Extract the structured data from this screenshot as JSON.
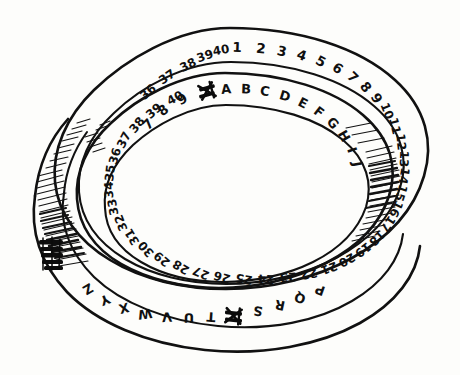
{
  "figure": {
    "medium": "ink sketch on white paper",
    "background_color": "#fdfdfb",
    "ink_color": "#111111",
    "annotation_note": "illegible handwritten scribble at left edge of band"
  },
  "outer_band": {
    "name": "numbered outer band",
    "label_kind": "numbers",
    "sequence_start": 1,
    "sequence_end": 40,
    "labels": [
      "1",
      "2",
      "3",
      "4",
      "5",
      "6",
      "7",
      "8",
      "9",
      "10",
      "11",
      "12",
      "13",
      "14",
      "15",
      "16",
      "17",
      "18",
      "19",
      "20",
      "21",
      "22",
      "23",
      "24",
      "25",
      "26",
      "27",
      "28",
      "29",
      "30",
      "31",
      "32",
      "33",
      "34",
      "35",
      "36",
      "37",
      "38",
      "39",
      "40"
    ]
  },
  "inner_band": {
    "name": "lettered inner band",
    "label_kind": "letters",
    "sequence_start": "A",
    "sequence_end": "Z",
    "labels": [
      "A",
      "B",
      "C",
      "D",
      "E",
      "F",
      "G",
      "H",
      "I",
      "J",
      "K",
      "L",
      "M",
      "N",
      "O",
      "P",
      "Q",
      "R",
      "S",
      "T",
      "U",
      "V",
      "W",
      "X",
      "Y",
      "Z"
    ],
    "extra_digits": [
      "7",
      "8",
      "9"
    ],
    "blotted_glyphs": 2,
    "blotted_note": "two heavily inked, crossed-out glyphs"
  },
  "shading": {
    "left_twist_label": "left twist cross-hatching",
    "right_twist_label": "right twist cross-hatching",
    "inner_twist_label": "inner edge cross-hatching"
  }
}
